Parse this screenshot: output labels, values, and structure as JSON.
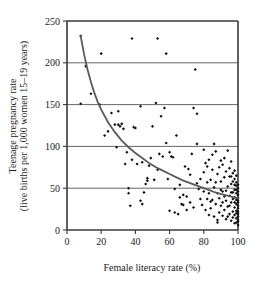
{
  "chart_data": {
    "type": "scatter",
    "title": "",
    "xlabel": "Female literacy rate (%)",
    "ylabel_line1": "Teenage pregnancy rate",
    "ylabel_line2": "(live births per 1,000 women 15–19 years)",
    "xlim": [
      0,
      100
    ],
    "ylim": [
      0,
      250
    ],
    "xticks": [
      0,
      20,
      40,
      60,
      80,
      100
    ],
    "yticks": [
      0,
      50,
      100,
      150,
      200,
      250
    ],
    "xtick_labels": [
      "0",
      "20",
      "40",
      "60",
      "80",
      "100"
    ],
    "ytick_labels": [
      "0",
      "50",
      "100",
      "150",
      "200",
      "250"
    ],
    "grid": "horizontal",
    "legend": "none",
    "marker": "small-black-diamond",
    "series": [
      {
        "name": "Countries",
        "points": [
          [
            8,
            232
          ],
          [
            11,
            196
          ],
          [
            8,
            151
          ],
          [
            20,
            211
          ],
          [
            22,
            113
          ],
          [
            29,
            99
          ],
          [
            30,
            142
          ],
          [
            31,
            124
          ],
          [
            30,
            126
          ],
          [
            33,
            121
          ],
          [
            35,
            93
          ],
          [
            34,
            79
          ],
          [
            36,
            50
          ],
          [
            37,
            29
          ],
          [
            38,
            229
          ],
          [
            39,
            123
          ],
          [
            41,
            79
          ],
          [
            43,
            148
          ],
          [
            43,
            35
          ],
          [
            44,
            81
          ],
          [
            45,
            45
          ],
          [
            47,
            59
          ],
          [
            47,
            62
          ],
          [
            49,
            86
          ],
          [
            50,
            124
          ],
          [
            52,
            152
          ],
          [
            53,
            229
          ],
          [
            53,
            72
          ],
          [
            55,
            136
          ],
          [
            57,
            146
          ],
          [
            58,
            211
          ],
          [
            58,
            104
          ],
          [
            59,
            61
          ],
          [
            60,
            93
          ],
          [
            61,
            88
          ],
          [
            62,
            87
          ],
          [
            63,
            49
          ],
          [
            63,
            21
          ],
          [
            64,
            113
          ],
          [
            65,
            19
          ],
          [
            66,
            39
          ],
          [
            67,
            31
          ],
          [
            68,
            42
          ],
          [
            69,
            76
          ],
          [
            70,
            40
          ],
          [
            71,
            73
          ],
          [
            72,
            66
          ],
          [
            73,
            91
          ],
          [
            74,
            146
          ],
          [
            75,
            192
          ],
          [
            76,
            139
          ],
          [
            76,
            103
          ],
          [
            77,
            49
          ],
          [
            78,
            61
          ],
          [
            79,
            30
          ],
          [
            80,
            69
          ],
          [
            80,
            96
          ],
          [
            81,
            80
          ],
          [
            82,
            57
          ],
          [
            82,
            76
          ],
          [
            83,
            84
          ],
          [
            83,
            44
          ],
          [
            84,
            60
          ],
          [
            84,
            26
          ],
          [
            85,
            72
          ],
          [
            85,
            36
          ],
          [
            86,
            103
          ],
          [
            86,
            51
          ],
          [
            87,
            94
          ],
          [
            87,
            31
          ],
          [
            88,
            12
          ],
          [
            88,
            9
          ],
          [
            88,
            67
          ],
          [
            89,
            38
          ],
          [
            89,
            75
          ],
          [
            90,
            29
          ],
          [
            90,
            83
          ],
          [
            90,
            58
          ],
          [
            91,
            17
          ],
          [
            91,
            46
          ],
          [
            91,
            78
          ],
          [
            92,
            24
          ],
          [
            92,
            63
          ],
          [
            92,
            86
          ],
          [
            93,
            35
          ],
          [
            93,
            13
          ],
          [
            93,
            70
          ],
          [
            94,
            52
          ],
          [
            94,
            95
          ],
          [
            94,
            28
          ],
          [
            95,
            41
          ],
          [
            95,
            19
          ],
          [
            95,
            74
          ],
          [
            95,
            64
          ],
          [
            96,
            33
          ],
          [
            96,
            11
          ],
          [
            96,
            55
          ],
          [
            96,
            82
          ],
          [
            96,
            45
          ],
          [
            97,
            22
          ],
          [
            97,
            68
          ],
          [
            97,
            37
          ],
          [
            97,
            15
          ],
          [
            97,
            58
          ],
          [
            98,
            48
          ],
          [
            98,
            27
          ],
          [
            98,
            8
          ],
          [
            98,
            71
          ],
          [
            98,
            39
          ],
          [
            98,
            61
          ],
          [
            98,
            18
          ],
          [
            99,
            53
          ],
          [
            99,
            31
          ],
          [
            99,
            14
          ],
          [
            99,
            44
          ],
          [
            99,
            23
          ],
          [
            99,
            65
          ],
          [
            99,
            36
          ],
          [
            99,
            9
          ],
          [
            99,
            57
          ],
          [
            100,
            42
          ],
          [
            100,
            26
          ],
          [
            100,
            12
          ],
          [
            100,
            50
          ],
          [
            100,
            33
          ],
          [
            100,
            19
          ],
          [
            100,
            6
          ],
          [
            100,
            46
          ],
          [
            100,
            38
          ],
          [
            100,
            29
          ],
          [
            100,
            16
          ],
          [
            100,
            22
          ],
          [
            100,
            54
          ],
          [
            100,
            10
          ],
          [
            100,
            35
          ],
          [
            99,
            48
          ],
          [
            99,
            20
          ],
          [
            98,
            33
          ],
          [
            98,
            54
          ],
          [
            97,
            45
          ],
          [
            96,
            64
          ],
          [
            95,
            29
          ],
          [
            94,
            16
          ],
          [
            93,
            47
          ],
          [
            92,
            40
          ],
          [
            91,
            33
          ],
          [
            90,
            48
          ],
          [
            89,
            21
          ],
          [
            88,
            44
          ],
          [
            87,
            57
          ],
          [
            86,
            16
          ],
          [
            85,
            90
          ],
          [
            84,
            34
          ],
          [
            83,
            18
          ],
          [
            82,
            37
          ],
          [
            81,
            24
          ],
          [
            80,
            46
          ],
          [
            78,
            37
          ],
          [
            76,
            56
          ],
          [
            74,
            27
          ],
          [
            72,
            33
          ],
          [
            70,
            24
          ],
          [
            68,
            30
          ],
          [
            66,
            54
          ],
          [
            60,
            23
          ],
          [
            56,
            88
          ],
          [
            54,
            91
          ],
          [
            51,
            60
          ],
          [
            48,
            77
          ],
          [
            46,
            55
          ],
          [
            44,
            31
          ],
          [
            40,
            122
          ],
          [
            38,
            84
          ],
          [
            36,
            44
          ],
          [
            32,
            127
          ],
          [
            28,
            126
          ],
          [
            26,
            140
          ],
          [
            24,
            118
          ],
          [
            19,
            150
          ],
          [
            14,
            163
          ]
        ]
      }
    ],
    "fit_curve": {
      "name": "Fitted decline curve",
      "points": [
        [
          8,
          232
        ],
        [
          10,
          210
        ],
        [
          12,
          192
        ],
        [
          14,
          177
        ],
        [
          16,
          164
        ],
        [
          18,
          153
        ],
        [
          20,
          144
        ],
        [
          24,
          129
        ],
        [
          28,
          117
        ],
        [
          32,
          107
        ],
        [
          36,
          99
        ],
        [
          40,
          92
        ],
        [
          44,
          86
        ],
        [
          48,
          80
        ],
        [
          52,
          75
        ],
        [
          56,
          71
        ],
        [
          60,
          67
        ],
        [
          64,
          63
        ],
        [
          68,
          59
        ],
        [
          72,
          56
        ],
        [
          76,
          53
        ],
        [
          80,
          50
        ],
        [
          84,
          47
        ],
        [
          88,
          44
        ],
        [
          92,
          42
        ],
        [
          96,
          40
        ],
        [
          100,
          38
        ]
      ]
    }
  },
  "axes": {
    "x_title": "Female literacy rate (%)",
    "y_title_line1": "Teenage pregnancy rate",
    "y_title_line2": "(live births per 1,000 women 15–19 years)"
  }
}
